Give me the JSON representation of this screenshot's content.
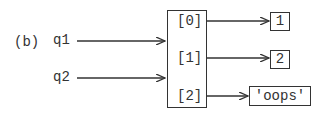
{
  "diagram": {
    "label": "(b)",
    "variables": [
      {
        "name": "q1",
        "points_to": "list"
      },
      {
        "name": "q2",
        "points_to": "list"
      }
    ],
    "list": {
      "slots": [
        {
          "index": "[0]",
          "value": "1"
        },
        {
          "index": "[1]",
          "value": "2"
        },
        {
          "index": "[2]",
          "value": "'oops'"
        }
      ]
    }
  }
}
